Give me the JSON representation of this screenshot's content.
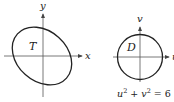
{
  "left_diagram": {
    "x_axis_label": "x",
    "y_axis_label": "y",
    "region_label": "T",
    "shape": "tilted ellipse"
  },
  "right_diagram": {
    "u_axis_label": "u",
    "v_axis_label": "v",
    "region_label": "D",
    "shape": "circle",
    "caption_lhs": "u",
    "caption_sup1": "2",
    "caption_plus": " + ",
    "caption_mid": "v",
    "caption_sup2": "2",
    "caption_eq": " = 6"
  },
  "colors": {
    "stroke": "#222222",
    "axis": "#444444",
    "background": "#ffffff"
  }
}
